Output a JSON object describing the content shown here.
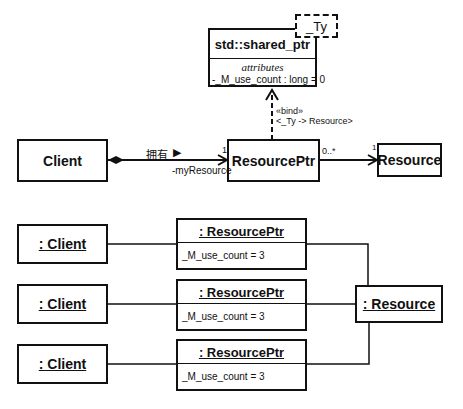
{
  "class_diagram": {
    "shared_ptr": {
      "name": "std::shared_ptr",
      "template_param": "_Ty",
      "section_label": "attributes",
      "attribute": "-_M_use_count : long = 0"
    },
    "bind": {
      "stereotype": "«bind»",
      "binding": "<_Ty -> Resource>"
    },
    "client": {
      "name": "Client"
    },
    "resource_ptr": {
      "name": "ResourcePtr"
    },
    "resource": {
      "name": "Resource"
    },
    "composition": {
      "label": "拥有",
      "direction_glyph": "▶",
      "multiplicity_target": "1",
      "role": "-myResource"
    },
    "association": {
      "multiplicity_source": "0..*",
      "multiplicity_target": "1"
    }
  },
  "object_diagram": {
    "clients": [
      {
        "name": ": Client"
      },
      {
        "name": ": Client"
      },
      {
        "name": ": Client"
      }
    ],
    "resource_ptrs": [
      {
        "name": ": ResourcePtr",
        "attribute": "_M_use_count = 3"
      },
      {
        "name": ": ResourcePtr",
        "attribute": "_M_use_count = 3"
      },
      {
        "name": ": ResourcePtr",
        "attribute": "_M_use_count = 3"
      }
    ],
    "resource": {
      "name": ": Resource"
    }
  }
}
